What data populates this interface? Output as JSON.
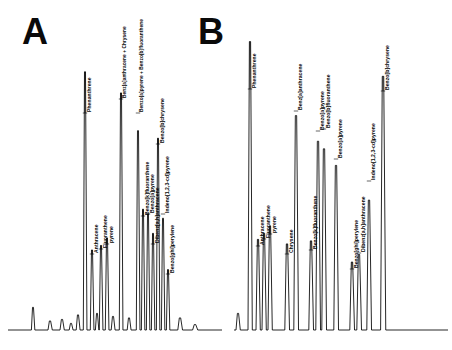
{
  "figure": {
    "type": "two-panel-chromatogram",
    "background_color": "#ffffff",
    "trace_color": "#000000",
    "label_color": "#050505"
  },
  "panels": [
    {
      "id": "A",
      "letter": "A",
      "letter_label": "A"
    },
    {
      "id": "B",
      "letter": "B",
      "letter_label": "B"
    }
  ],
  "chart_data": [
    {
      "type": "line",
      "title": "A",
      "xlabel": "",
      "ylabel": "",
      "grid": false,
      "legend": "none",
      "axis_visible": false,
      "baseline_y": 330,
      "xlim": [
        20,
        210
      ],
      "ylim": [
        0,
        1
      ],
      "annotations": [
        "A"
      ],
      "peaks": [
        {
          "label": "",
          "x": 33,
          "height": 0.075,
          "width": 1.6,
          "labeled": false
        },
        {
          "label": "",
          "x": 50,
          "height": 0.03,
          "width": 2.0,
          "labeled": false
        },
        {
          "label": "",
          "x": 62,
          "height": 0.035,
          "width": 2.0,
          "labeled": false
        },
        {
          "label": "",
          "x": 71,
          "height": 0.022,
          "width": 1.8,
          "labeled": false
        },
        {
          "label": "",
          "x": 78,
          "height": 0.05,
          "width": 1.8,
          "labeled": false
        },
        {
          "label": "Phenanthrene",
          "x": 85,
          "height": 0.855,
          "width": 1.7,
          "labeled": true,
          "label_y": 112
        },
        {
          "label": "Anthracene",
          "x": 92,
          "height": 0.265,
          "width": 1.7,
          "labeled": true,
          "label_y": 253
        },
        {
          "label": "",
          "x": 97,
          "height": 0.055,
          "width": 1.6,
          "labeled": false
        },
        {
          "label": "Fluoranthene",
          "x": 101,
          "height": 0.28,
          "width": 1.7,
          "labeled": true,
          "label_y": 248
        },
        {
          "label": "pyrene",
          "x": 107,
          "height": 0.305,
          "width": 1.7,
          "labeled": true,
          "label_y": 243
        },
        {
          "label": "",
          "x": 113,
          "height": 0.045,
          "width": 1.8,
          "labeled": false
        },
        {
          "label": "Benz[a]anthracene + Chrysene",
          "x": 121,
          "height": 0.785,
          "width": 1.7,
          "labeled": true,
          "label_y": 98
        },
        {
          "label": "",
          "x": 129,
          "height": 0.04,
          "width": 1.8,
          "labeled": false
        },
        {
          "label": "Benzo[a]pyrene + Benzo[b]fluoranthene",
          "x": 138,
          "height": 0.66,
          "width": 1.7,
          "labeled": true,
          "label_y": 112
        },
        {
          "label": "Benzo[k]fluoranthene",
          "x": 143,
          "height": 0.4,
          "width": 1.6,
          "labeled": true,
          "label_y": 215
        },
        {
          "label": "Benzo[a]pyrene",
          "x": 148,
          "height": 0.385,
          "width": 1.6,
          "labeled": true,
          "label_y": 213
        },
        {
          "label": "Dibenz[a,h]anthracene",
          "x": 153,
          "height": 0.32,
          "width": 1.6,
          "labeled": true,
          "label_y": 243
        },
        {
          "label": "Benzo[b]chrysene",
          "x": 158,
          "height": 0.635,
          "width": 1.6,
          "labeled": true,
          "label_y": 143
        },
        {
          "label": "Indeno[1,2,3-cd]pyrene",
          "x": 163,
          "height": 0.37,
          "width": 1.6,
          "labeled": true,
          "label_y": 213
        },
        {
          "label": "Benzo[ghi]perylene",
          "x": 168,
          "height": 0.2,
          "width": 1.6,
          "labeled": true,
          "label_y": 273
        },
        {
          "label": "",
          "x": 180,
          "height": 0.04,
          "width": 2.2,
          "labeled": false
        },
        {
          "label": "",
          "x": 195,
          "height": 0.018,
          "width": 2.4,
          "labeled": false
        }
      ],
      "labels": [
        "Phenanthrene",
        "Anthracene",
        "Fluoranthene",
        "pyrene",
        "Benz[a]anthracene + Chrysene",
        "Benzo[a]pyrene + Benzo[b]fluoranthene",
        "Benzo[k]fluoranthene",
        "Benzo[a]pyrene",
        "Dibenz[a,h]anthracene",
        "Benzo[b]chrysene",
        "Indeno[1,2,3-cd]pyrene",
        "Benzo[ghi]perylene"
      ]
    },
    {
      "type": "line",
      "title": "B",
      "xlabel": "",
      "ylabel": "",
      "grid": false,
      "legend": "none",
      "axis_visible": false,
      "baseline_y": 330,
      "xlim": [
        0,
        226
      ],
      "ylim": [
        0,
        1
      ],
      "annotations": [
        "B"
      ],
      "peaks": [
        {
          "label": "",
          "x": 12,
          "height": 0.055,
          "width": 2.0,
          "labeled": false
        },
        {
          "label": "Phenanthrene",
          "x": 24,
          "height": 0.955,
          "width": 2.0,
          "labeled": true,
          "label_y": 88
        },
        {
          "label": "Anthracene",
          "x": 32,
          "height": 0.3,
          "width": 2.0,
          "labeled": true,
          "label_y": 245
        },
        {
          "label": "Fluoranthene",
          "x": 38,
          "height": 0.32,
          "width": 2.0,
          "labeled": true,
          "label_y": 238
        },
        {
          "label": "pyrene",
          "x": 44,
          "height": 0.345,
          "width": 2.0,
          "labeled": true,
          "label_y": 233
        },
        {
          "label": "Chrysene",
          "x": 61,
          "height": 0.285,
          "width": 2.2,
          "labeled": true,
          "label_y": 253
        },
        {
          "label": "Benz[a]anthracene",
          "x": 70,
          "height": 0.71,
          "width": 2.2,
          "labeled": true,
          "label_y": 110
        },
        {
          "label": "Benzo[k]fluoranthene",
          "x": 85,
          "height": 0.295,
          "width": 2.2,
          "labeled": true,
          "label_y": 249
        },
        {
          "label": "Benzo[a]pyrene",
          "x": 92,
          "height": 0.625,
          "width": 2.2,
          "labeled": true,
          "label_y": 130
        },
        {
          "label": "Benzo[b]fluoranthene",
          "x": 98,
          "height": 0.6,
          "width": 2.2,
          "labeled": true,
          "label_y": 128
        },
        {
          "label": "Benzo[a]pyrene",
          "x": 110,
          "height": 0.545,
          "width": 2.2,
          "labeled": true,
          "label_y": 158
        },
        {
          "label": "Benzo[ghi]perylene",
          "x": 126,
          "height": 0.225,
          "width": 2.2,
          "labeled": true,
          "label_y": 268
        },
        {
          "label": "Dibenz[a,h]anthracene",
          "x": 133,
          "height": 0.25,
          "width": 2.2,
          "labeled": true,
          "label_y": 252
        },
        {
          "label": "Indeno[1,2,3-cd]pyrene",
          "x": 143,
          "height": 0.43,
          "width": 2.2,
          "labeled": true,
          "label_y": 180
        },
        {
          "label": "Benzo[b]chrysene",
          "x": 157,
          "height": 0.84,
          "width": 2.4,
          "labeled": true,
          "label_y": 90
        }
      ],
      "labels": [
        "Phenanthrene",
        "Anthracene",
        "Fluoranthene",
        "pyrene",
        "Chrysene",
        "Benz[a]anthracene",
        "Benzo[k]fluoranthene",
        "Benzo[a]pyrene",
        "Benzo[b]fluoranthene",
        "Benzo[a]pyrene",
        "Benzo[ghi]perylene",
        "Dibenz[a,h]anthracene",
        "Indeno[1,2,3-cd]pyrene",
        "Benzo[b]chrysene"
      ]
    }
  ]
}
